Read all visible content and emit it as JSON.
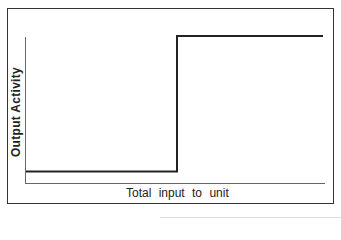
{
  "diagram": {
    "type": "step-function",
    "y_axis_label": "Output Activity",
    "x_axis_label": "Total input to unit",
    "colors": {
      "line": "#222222",
      "axis": "#555555",
      "frame": "#333333"
    },
    "curve": {
      "low_level_y": 171,
      "high_level_y": 36,
      "step_x": 177,
      "start_x": 26,
      "end_x": 323
    }
  }
}
